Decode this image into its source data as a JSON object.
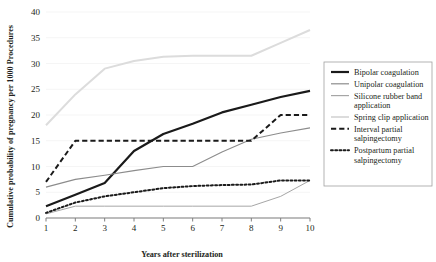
{
  "chart_data": {
    "type": "line",
    "title": "",
    "xlabel": "Years after sterilization",
    "ylabel": "Cumulative probability of pregnancy per 1000 Procedures",
    "x": [
      1,
      2,
      3,
      4,
      5,
      6,
      7,
      8,
      9,
      10
    ],
    "xtick_labels": [
      "1",
      "2",
      "3",
      "4",
      "5",
      "6",
      "7",
      "8",
      "9",
      "10"
    ],
    "ytick_labels": [
      "0",
      "5",
      "10",
      "15",
      "20",
      "25",
      "30",
      "35",
      "40"
    ],
    "yticks": [
      0,
      5,
      10,
      15,
      20,
      25,
      30,
      35,
      40
    ],
    "xlim": [
      1,
      10
    ],
    "ylim": [
      0,
      40
    ],
    "grid": true,
    "legend_position": "right",
    "series": [
      {
        "name": "Bipolar coagulation",
        "style": "solid",
        "color": "#1a1a1a",
        "width": 2.2,
        "values": [
          2.3,
          4.5,
          6.8,
          13.0,
          16.3,
          18.3,
          20.5,
          22.0,
          23.5,
          24.7
        ]
      },
      {
        "name": "Unipolar coagulation",
        "style": "solid",
        "color": "#8c8c8c",
        "width": 1.1,
        "values": [
          6.0,
          7.5,
          8.3,
          9.2,
          10.0,
          10.0,
          12.8,
          15.3,
          16.5,
          17.5
        ]
      },
      {
        "name": "Silicone rubber band application",
        "style": "solid",
        "color": "#a6a6a6",
        "width": 1.0,
        "values": [
          0.8,
          2.3,
          2.3,
          2.3,
          2.3,
          2.3,
          2.3,
          2.3,
          4.2,
          7.3
        ]
      },
      {
        "name": "Spring clip application",
        "style": "solid",
        "color": "#dcdcdc",
        "width": 2.0,
        "values": [
          18.0,
          24.0,
          29.0,
          30.5,
          31.3,
          31.5,
          31.5,
          31.5,
          34.0,
          36.5
        ]
      },
      {
        "name": "Interval partial salpingectomy",
        "style": "dashed",
        "color": "#1a1a1a",
        "width": 2.0,
        "values": [
          7.0,
          15.0,
          15.0,
          15.0,
          15.0,
          15.0,
          15.0,
          15.0,
          20.0,
          20.0
        ]
      },
      {
        "name": "Postpartum partial salpingectomy",
        "style": "dotted",
        "color": "#1a1a1a",
        "width": 2.0,
        "values": [
          1.0,
          3.0,
          4.2,
          5.0,
          5.8,
          6.2,
          6.4,
          6.5,
          7.3,
          7.3
        ]
      }
    ]
  },
  "legend": {
    "items": [
      {
        "label": "Bipolar coagulation",
        "label2": ""
      },
      {
        "label": "Unipolar coagulation",
        "label2": ""
      },
      {
        "label": "Silicone rubber band",
        "label2": "application"
      },
      {
        "label": "Spring clip application",
        "label2": ""
      },
      {
        "label": "Interval partial",
        "label2": "salpingectomy"
      },
      {
        "label": "Postpartum partial",
        "label2": "salpingectomy"
      }
    ]
  },
  "colors": {
    "axis": "#7f7f7f",
    "grid": "#f2f2f2",
    "text": "#231f20",
    "legend_border": "#a0a0a0",
    "background": "#ffffff"
  }
}
